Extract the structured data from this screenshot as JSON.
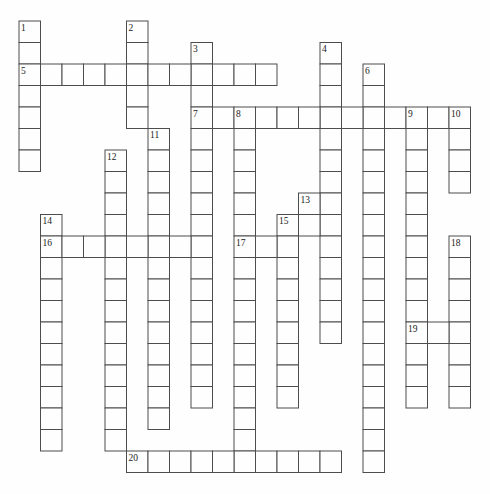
{
  "puzzle": {
    "type": "crossword",
    "title": "",
    "grid": {
      "rows": 21,
      "cols": 21
    },
    "colors": {
      "background": "#fefefe",
      "cell_fill": "#fefefe",
      "grid_line": "#4d4d4d",
      "number_text": "#1a1a1a"
    },
    "words": [
      {
        "number": 1,
        "direction": "down",
        "row": 0,
        "col": 0,
        "length": 7
      },
      {
        "number": 2,
        "direction": "down",
        "row": 0,
        "col": 5,
        "length": 5
      },
      {
        "number": 3,
        "direction": "down",
        "row": 1,
        "col": 8,
        "length": 17
      },
      {
        "number": 4,
        "direction": "down",
        "row": 1,
        "col": 14,
        "length": 14
      },
      {
        "number": 5,
        "direction": "across",
        "row": 2,
        "col": 0,
        "length": 12
      },
      {
        "number": 6,
        "direction": "down",
        "row": 2,
        "col": 16,
        "length": 19
      },
      {
        "number": 7,
        "direction": "across",
        "row": 4,
        "col": 8,
        "length": 13
      },
      {
        "number": 8,
        "direction": "down",
        "row": 4,
        "col": 10,
        "length": 17
      },
      {
        "number": 9,
        "direction": "down",
        "row": 4,
        "col": 18,
        "length": 14
      },
      {
        "number": 10,
        "direction": "down",
        "row": 4,
        "col": 20,
        "length": 4
      },
      {
        "number": 11,
        "direction": "down",
        "row": 5,
        "col": 6,
        "length": 14
      },
      {
        "number": 12,
        "direction": "down",
        "row": 6,
        "col": 4,
        "length": 14
      },
      {
        "number": 13,
        "direction": "across",
        "row": 8,
        "col": 13,
        "length": 2
      },
      {
        "number": 13,
        "direction": "down",
        "row": 8,
        "col": 13,
        "length": 2
      },
      {
        "number": 14,
        "direction": "down",
        "row": 9,
        "col": 1,
        "length": 11
      },
      {
        "number": 15,
        "direction": "across",
        "row": 9,
        "col": 12,
        "length": 3
      },
      {
        "number": 15,
        "direction": "down",
        "row": 9,
        "col": 12,
        "length": 9
      },
      {
        "number": 16,
        "direction": "across",
        "row": 10,
        "col": 1,
        "length": 8
      },
      {
        "number": 17,
        "direction": "across",
        "row": 10,
        "col": 10,
        "length": 3
      },
      {
        "number": 18,
        "direction": "down",
        "row": 10,
        "col": 20,
        "length": 8
      },
      {
        "number": 19,
        "direction": "across",
        "row": 14,
        "col": 18,
        "length": 3
      },
      {
        "number": 20,
        "direction": "across",
        "row": 20,
        "col": 5,
        "length": 10
      }
    ],
    "numbers": [
      {
        "label": "1",
        "col": 0,
        "row": 0
      },
      {
        "label": "2",
        "col": 5,
        "row": 0
      },
      {
        "label": "3",
        "col": 8,
        "row": 1
      },
      {
        "label": "4",
        "col": 14,
        "row": 1
      },
      {
        "label": "5",
        "col": 0,
        "row": 2
      },
      {
        "label": "6",
        "col": 16,
        "row": 2
      },
      {
        "label": "7",
        "col": 8,
        "row": 4
      },
      {
        "label": "8",
        "col": 10,
        "row": 4
      },
      {
        "label": "9",
        "col": 18,
        "row": 4
      },
      {
        "label": "10",
        "col": 20,
        "row": 4
      },
      {
        "label": "11",
        "col": 6,
        "row": 5
      },
      {
        "label": "12",
        "col": 4,
        "row": 6
      },
      {
        "label": "13",
        "col": 13,
        "row": 8
      },
      {
        "label": "14",
        "col": 1,
        "row": 9
      },
      {
        "label": "15",
        "col": 12,
        "row": 9
      },
      {
        "label": "16",
        "col": 1,
        "row": 10
      },
      {
        "label": "17",
        "col": 10,
        "row": 10
      },
      {
        "label": "18",
        "col": 20,
        "row": 10
      },
      {
        "label": "19",
        "col": 18,
        "row": 14
      },
      {
        "label": "20",
        "col": 5,
        "row": 20
      }
    ]
  }
}
